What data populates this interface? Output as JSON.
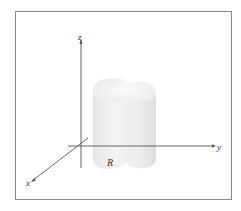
{
  "figure": {
    "axes": {
      "x_label": "x",
      "y_label": "y",
      "z_label": "z"
    },
    "region_label": "R",
    "solid": "cylinder-like solid over region R",
    "colors": {
      "frame": "#8a8a8a",
      "axis": "#444444",
      "solid_fill": "#ececec",
      "solid_top": "#f6f6f6"
    }
  }
}
